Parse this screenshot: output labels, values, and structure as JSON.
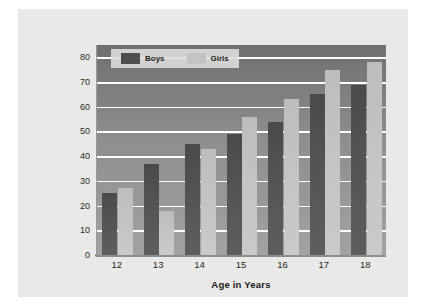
{
  "chart_data": {
    "type": "bar",
    "title": "",
    "xlabel": "Age in Years",
    "ylabel": "Percentage Reporting a Romantic Relationship in the Past 18 Months",
    "ylabel_line1": "Percentage Reporting a Romantic",
    "ylabel_line2": "Relationship in the Past 18 Months",
    "categories": [
      "12",
      "13",
      "14",
      "15",
      "16",
      "17",
      "18"
    ],
    "series": [
      {
        "name": "Boys",
        "color": "#4e4e4e",
        "values": [
          25,
          37,
          45,
          49,
          54,
          65,
          69
        ]
      },
      {
        "name": "Girls",
        "color": "#c3c3c3",
        "values": [
          27,
          18,
          43,
          56,
          63,
          75,
          78
        ]
      }
    ],
    "ylim": [
      0,
      85
    ],
    "yticks": [
      0,
      10,
      20,
      30,
      40,
      50,
      60,
      70,
      80
    ],
    "ytick_labels": [
      "0",
      "10",
      "20",
      "30",
      "40",
      "50",
      "60",
      "70",
      "80"
    ],
    "grid": true,
    "legend_position": "top-left",
    "legend": [
      "Boys",
      "Girls"
    ]
  }
}
